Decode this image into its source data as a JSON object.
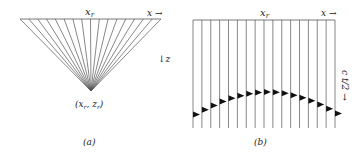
{
  "panel_a": {
    "caption": "(a)",
    "label_xr": "x",
    "label_xr_sub": "r",
    "label_x_axis": "x →",
    "label_z_axis": "↓z",
    "apex_label": "(x",
    "apex_label_sub1": "r",
    "apex_label_mid": ", z",
    "apex_label_sub2": "r",
    "apex_label_end": ")",
    "ray_count": 17
  },
  "panel_b": {
    "caption": "(b)",
    "label_xr": "x",
    "label_xr_sub": "r",
    "label_x_axis": "x →",
    "label_time_axis": "c t/2 →",
    "trace_count": 17
  },
  "colors": {
    "line": "#555555",
    "ink": "#111111",
    "background": "#ffffff"
  }
}
